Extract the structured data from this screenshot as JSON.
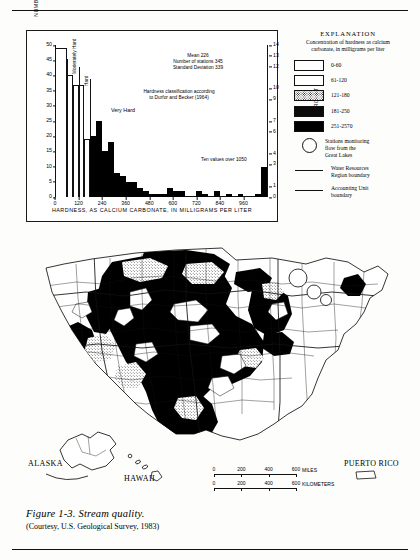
{
  "figure": {
    "caption_title": "Figure 1-3.  Stream quality.",
    "caption_credit": "(Courtesy, U.S. Geological Survey, 1983)"
  },
  "chart_data": {
    "type": "bar",
    "title": "",
    "xlabel": "HARDNESS, AS CALCIUM CARBONATE, IN MILLIGRAMS PER LITER",
    "ylabel": "NUMBER OF STATIONS",
    "ylabel_right": "PERCENT",
    "xlim": [
      0,
      1080
    ],
    "ylim": [
      0,
      50
    ],
    "ylim_right": [
      0,
      14
    ],
    "grid": false,
    "xticks": [
      0,
      120,
      240,
      360,
      480,
      600,
      720,
      840,
      960
    ],
    "yticks": [
      0,
      5,
      10,
      15,
      20,
      25,
      30,
      35,
      40,
      45,
      50
    ],
    "yticks_right": [
      0,
      1,
      3,
      4,
      6,
      7,
      9,
      10,
      12,
      13,
      14
    ],
    "bin_width": 30,
    "bins": [
      {
        "x0": 0,
        "x1": 60,
        "value": 49,
        "fill": "open"
      },
      {
        "x0": 60,
        "x1": 90,
        "value": 40,
        "fill": "open"
      },
      {
        "x0": 90,
        "x1": 120,
        "value": 37,
        "fill": "open"
      },
      {
        "x0": 120,
        "x1": 150,
        "value": 37,
        "fill": "stipple"
      },
      {
        "x0": 150,
        "x1": 180,
        "value": 19,
        "fill": "stipple"
      },
      {
        "x0": 180,
        "x1": 210,
        "value": 20,
        "fill": "solid"
      },
      {
        "x0": 210,
        "x1": 240,
        "value": 25,
        "fill": "solid"
      },
      {
        "x0": 240,
        "x1": 270,
        "value": 15,
        "fill": "solid"
      },
      {
        "x0": 270,
        "x1": 300,
        "value": 18,
        "fill": "solid"
      },
      {
        "x0": 300,
        "x1": 330,
        "value": 8,
        "fill": "solid"
      },
      {
        "x0": 330,
        "x1": 360,
        "value": 7,
        "fill": "solid"
      },
      {
        "x0": 360,
        "x1": 420,
        "value": 5,
        "fill": "solid"
      },
      {
        "x0": 420,
        "x1": 450,
        "value": 3,
        "fill": "solid"
      },
      {
        "x0": 450,
        "x1": 480,
        "value": 2,
        "fill": "solid"
      },
      {
        "x0": 480,
        "x1": 540,
        "value": 1,
        "fill": "solid"
      },
      {
        "x0": 540,
        "x1": 570,
        "value": 1,
        "fill": "solid"
      },
      {
        "x0": 570,
        "x1": 600,
        "value": 3,
        "fill": "solid"
      },
      {
        "x0": 600,
        "x1": 630,
        "value": 2,
        "fill": "solid"
      },
      {
        "x0": 630,
        "x1": 660,
        "value": 2,
        "fill": "solid"
      },
      {
        "x0": 720,
        "x1": 750,
        "value": 2,
        "fill": "solid"
      },
      {
        "x0": 750,
        "x1": 780,
        "value": 1,
        "fill": "solid"
      },
      {
        "x0": 810,
        "x1": 840,
        "value": 2,
        "fill": "solid"
      },
      {
        "x0": 870,
        "x1": 900,
        "value": 1,
        "fill": "solid"
      },
      {
        "x0": 930,
        "x1": 960,
        "value": 1,
        "fill": "solid"
      },
      {
        "x0": 1020,
        "x1": 1050,
        "value": 1,
        "fill": "solid"
      },
      {
        "x0": 1050,
        "x1": 1080,
        "value": 10,
        "fill": "solid"
      }
    ],
    "classes": [
      {
        "label": "Soft",
        "x0": 0,
        "x1": 60
      },
      {
        "label": "Moderately Hard",
        "x0": 60,
        "x1": 120
      },
      {
        "label": "Hard",
        "x0": 120,
        "x1": 180
      },
      {
        "label": "Very Hard",
        "x0": 180,
        "x1": 1080
      }
    ],
    "annotations": [
      {
        "name": "statistics",
        "lines": [
          "Mean 226",
          "Number of stations 345",
          "Standard Deviation 339"
        ]
      },
      {
        "name": "classification",
        "lines": [
          "Hardness classification according",
          "to Durfor and Becker (1964)"
        ]
      },
      {
        "name": "overflow",
        "lines": [
          "Ten values over 1050"
        ]
      },
      {
        "name": "very-hard",
        "lines": [
          "Very Hard"
        ]
      }
    ]
  },
  "explanation": {
    "title": "EXPLANATION",
    "subtitle_line1": "Concentration of hardness as calcium",
    "subtitle_line2": "carbonate, in milligrams per liter",
    "classes": [
      {
        "label": "0-60",
        "fill": "open"
      },
      {
        "label": "61-120",
        "fill": "open"
      },
      {
        "label": "121-180",
        "fill": "stipple"
      },
      {
        "label": "181-250",
        "fill": "dark"
      },
      {
        "label": "251-2570",
        "fill": "solid"
      }
    ],
    "symbols": [
      {
        "name": "great-lakes-station",
        "icon": "circle-outline",
        "lines": [
          "Stations monitoring",
          "flow from the",
          "Great Lakes"
        ]
      },
      {
        "name": "water-resources-region",
        "icon": "line-segment",
        "lines": [
          "Water Resources",
          "Region boundary"
        ]
      },
      {
        "name": "accounting-unit",
        "icon": "line-segment",
        "lines": [
          "Accounting Unit",
          "boundary"
        ]
      }
    ]
  },
  "map": {
    "labels": [
      {
        "name": "alaska",
        "text": "ALASKA"
      },
      {
        "name": "hawaii",
        "text": "HAWAII"
      },
      {
        "name": "puerto-rico",
        "text": "PUERTO RICO"
      }
    ],
    "scale_miles": {
      "unit": "MILES",
      "ticks": [
        "0",
        "200",
        "400",
        "600"
      ]
    },
    "scale_km": {
      "unit": "KILOMETERS",
      "ticks": [
        "0",
        "200",
        "400",
        "600"
      ]
    }
  },
  "colors": {
    "ink": "#111111",
    "paper": "#fdfdfb",
    "solid_fill": "#000000"
  }
}
